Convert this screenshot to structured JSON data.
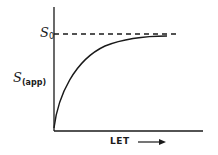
{
  "diagram": {
    "y_axis_label": {
      "symbol": "S",
      "subscript": "(app)"
    },
    "saturation_label": {
      "symbol": "S",
      "subscript": "0"
    },
    "x_axis_label": "LET",
    "x_axis_arrow": "→",
    "curve": "saturating rise of S(app) with increasing LET, approaching S0",
    "asymptote": "dashed horizontal line at S0",
    "colors": {
      "line": "#1a1a1a",
      "background": "#ffffff"
    }
  }
}
